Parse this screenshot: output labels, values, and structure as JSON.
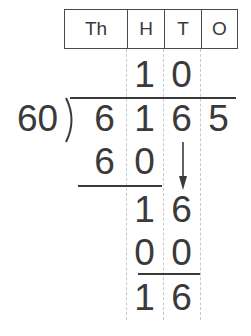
{
  "place_value_header": [
    "Th",
    "H",
    "T",
    "O"
  ],
  "quotient": [
    "1",
    "0"
  ],
  "divisor": "60",
  "dividend": [
    "6",
    "1",
    "6",
    "5"
  ],
  "steps": {
    "subtract1": [
      "6",
      "0"
    ],
    "remainder1": [
      "1",
      "6"
    ],
    "subtract2": [
      "0",
      "0"
    ],
    "remainder2": [
      "1",
      "6"
    ]
  },
  "arrow_icon": "down-arrow-icon",
  "colors": {
    "ink": "#3a3a3a",
    "guide": "#c8c8c8"
  }
}
